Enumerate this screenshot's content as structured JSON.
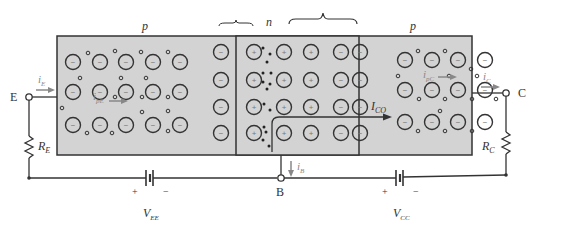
{
  "regions": {
    "left": {
      "label": "p"
    },
    "middle": {
      "label": "n"
    },
    "right": {
      "label": "p"
    }
  },
  "terminals": {
    "emitter": "E",
    "base": "B",
    "collector": "C"
  },
  "currents": {
    "iE": {
      "main": "i",
      "sub": "E"
    },
    "ipE": {
      "main": "i",
      "sub": "pE"
    },
    "ICO": {
      "main": "I",
      "sub": "CO"
    },
    "ipC": {
      "main": "i",
      "sub": "pC"
    },
    "iC": {
      "main": "i",
      "sub": "C"
    },
    "iB": {
      "main": "i",
      "sub": "B"
    }
  },
  "components": {
    "RE": {
      "main": "R",
      "sub": "E"
    },
    "RC": {
      "main": "R",
      "sub": "C"
    },
    "VEE": {
      "main": "V",
      "sub": "EE",
      "plus": "+",
      "minus": "−"
    },
    "VCC": {
      "main": "V",
      "sub": "CC",
      "plus": "+",
      "minus": "−"
    }
  },
  "ion_symbols": {
    "acceptor": "−",
    "donor": "+"
  },
  "colors": {
    "semiconductor_fill": "#d3d3d3",
    "line": "#333333",
    "arrow": "#8a8a8a",
    "label": "#444444"
  }
}
